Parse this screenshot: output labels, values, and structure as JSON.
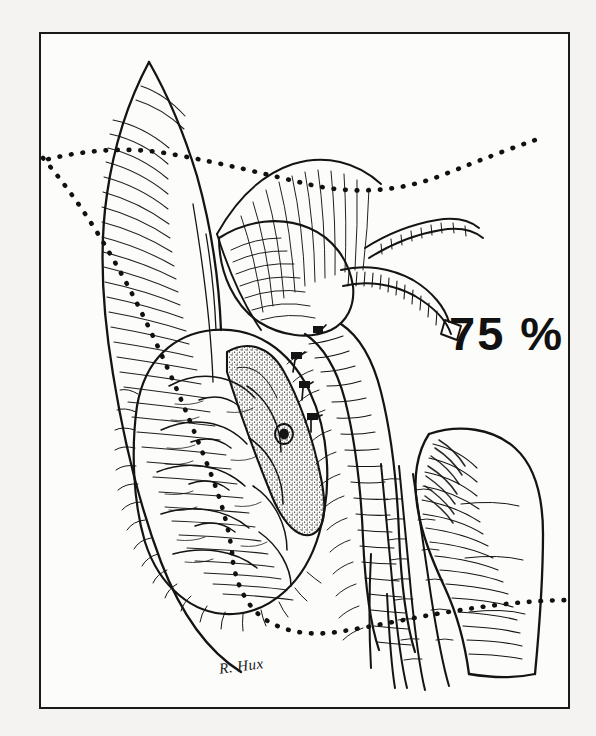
{
  "document": {
    "type": "medical-illustration",
    "medium": "pen-and-ink line drawing",
    "subject": "Pancreaticoduodenectomy (Whipple procedure) — extent of pancreatic resection",
    "background_color": "#f3f2f0",
    "plate_background_color": "#fcfcfb",
    "ink_color": "#111111",
    "frame": {
      "name": "plate-border",
      "color": "#1a1a1a",
      "width_px": 2.5,
      "left": 39,
      "top": 32,
      "width": 531,
      "height": 677
    }
  },
  "annotations": {
    "resection_percent_label": "75 %",
    "resection_percent_value": 75,
    "resection_percent_color": "#111111",
    "artist_signature": "R. Hux"
  },
  "anatomy": {
    "structures": [
      {
        "name": "stomach",
        "position": "left",
        "rendering": "cross-hatched serosal folds"
      },
      {
        "name": "duodenum",
        "position": "center",
        "rendering": "banded tubular loop with ligated vessel clips"
      },
      {
        "name": "pancreas-head",
        "position": "center-left",
        "rendering": "lobulated gland body"
      },
      {
        "name": "pancreatic-cut-surface",
        "position": "center",
        "rendering": "stippled transected face with duct orifice"
      },
      {
        "name": "pancreatic-duct",
        "position": "center",
        "rendering": "small ringed orifice on cut surface"
      },
      {
        "name": "common-bile-duct",
        "position": "upper-center",
        "rendering": "transected banded duct"
      },
      {
        "name": "gastroduodenal-artery-stump",
        "position": "upper-right",
        "rendering": "cut vessel stump"
      },
      {
        "name": "superior-mesenteric-vessels",
        "position": "right",
        "rendering": "parallel banded vessels descending"
      },
      {
        "name": "jejunum-loop",
        "position": "lower-right",
        "rendering": "cross-hatched bowel loop"
      },
      {
        "name": "ligature-clips",
        "position": "center",
        "count": 4,
        "rendering": "small tied vessel ligatures"
      }
    ],
    "resection_line": {
      "name": "dotted-resection-line",
      "style": "dotted",
      "color": "#111111",
      "description": "dotted boundary sweeping from upper-left across the top, curving down the midline and out to the right past the jejunum, delimiting the 75% resection specimen"
    }
  }
}
